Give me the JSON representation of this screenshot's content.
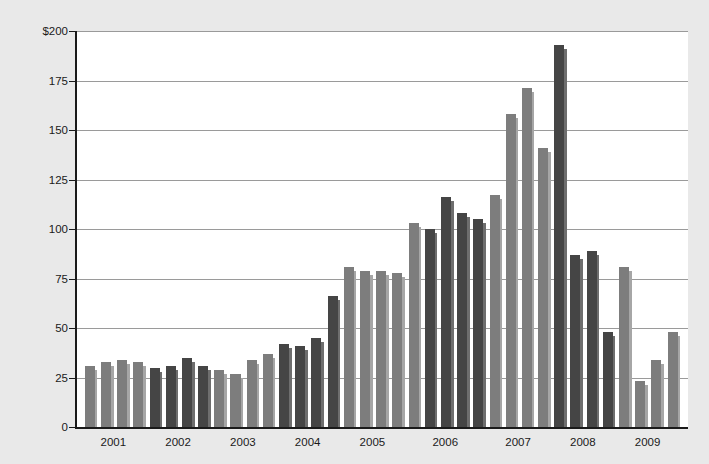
{
  "chart_data": {
    "type": "bar",
    "title": "",
    "subtitle": "",
    "xlabel": "",
    "ylabel": "",
    "ylim": [
      0,
      200
    ],
    "yticks": [
      0,
      25,
      50,
      75,
      100,
      125,
      150,
      175,
      200
    ],
    "ytick_labels": [
      "0",
      "25",
      "50",
      "75",
      "100",
      "125",
      "150",
      "175",
      "$200"
    ],
    "grid": true,
    "legend": "none",
    "categories": [
      "2001",
      "2002",
      "2003",
      "2004",
      "2005",
      "2006",
      "2007",
      "2008",
      "2009"
    ],
    "bars_per_category": 4,
    "colors": {
      "light_series": "#7d7d7d",
      "dark_series": "#454545",
      "light_shadow": "#a6a6a6",
      "dark_shadow": "#6e6e6e",
      "gridline": "#9a9a9a",
      "axis": "#1a1a1a",
      "plot_background": "#ffffff",
      "page_background": "#e9e9e9"
    },
    "groups": [
      {
        "category": "2001",
        "shade": "light",
        "values": [
          31,
          26,
          33,
          29,
          34,
          30,
          33,
          30
        ]
      },
      {
        "category": "2002",
        "shade": "dark",
        "values": [
          30,
          28,
          31,
          29,
          35,
          31,
          31,
          28
        ]
      },
      {
        "category": "2003",
        "shade": "light",
        "values": [
          29,
          27,
          27,
          25,
          34,
          31,
          37,
          33
        ]
      },
      {
        "category": "2004",
        "shade": "dark",
        "values": [
          42,
          40,
          41,
          39,
          45,
          42,
          66,
          62
        ]
      },
      {
        "category": "2005",
        "shade": "light",
        "values": [
          81,
          80,
          79,
          78,
          79,
          77,
          78,
          76
        ]
      },
      {
        "category": "2006",
        "shade": "dark",
        "values": [
          103,
          100,
          100,
          99,
          116,
          112,
          108,
          105,
          105,
          102
        ]
      },
      {
        "category": "2007",
        "shade": "light",
        "values": [
          117,
          113,
          158,
          152,
          171,
          166,
          141,
          137
        ]
      },
      {
        "category": "2008",
        "shade": "dark",
        "values": [
          193,
          189,
          87,
          85,
          89,
          87,
          48,
          45
        ]
      },
      {
        "category": "2009",
        "shade": "light",
        "values": [
          81,
          78,
          23,
          20,
          34,
          31,
          48,
          45
        ]
      }
    ],
    "series_flat": [
      {
        "year": "2001",
        "quarter": 1,
        "value": 31,
        "shade": "light"
      },
      {
        "year": "2001",
        "quarter": 2,
        "value": 33,
        "shade": "light"
      },
      {
        "year": "2001",
        "quarter": 3,
        "value": 34,
        "shade": "light"
      },
      {
        "year": "2001",
        "quarter": 4,
        "value": 33,
        "shade": "light"
      },
      {
        "year": "2002",
        "quarter": 1,
        "value": 30,
        "shade": "dark"
      },
      {
        "year": "2002",
        "quarter": 2,
        "value": 31,
        "shade": "dark"
      },
      {
        "year": "2002",
        "quarter": 3,
        "value": 35,
        "shade": "dark"
      },
      {
        "year": "2002",
        "quarter": 4,
        "value": 31,
        "shade": "dark"
      },
      {
        "year": "2003",
        "quarter": 1,
        "value": 29,
        "shade": "light"
      },
      {
        "year": "2003",
        "quarter": 2,
        "value": 27,
        "shade": "light"
      },
      {
        "year": "2003",
        "quarter": 3,
        "value": 34,
        "shade": "light"
      },
      {
        "year": "2003",
        "quarter": 4,
        "value": 37,
        "shade": "light"
      },
      {
        "year": "2004",
        "quarter": 1,
        "value": 42,
        "shade": "dark"
      },
      {
        "year": "2004",
        "quarter": 2,
        "value": 41,
        "shade": "dark"
      },
      {
        "year": "2004",
        "quarter": 3,
        "value": 45,
        "shade": "dark"
      },
      {
        "year": "2004",
        "quarter": 4,
        "value": 66,
        "shade": "dark"
      },
      {
        "year": "2005",
        "quarter": 1,
        "value": 81,
        "shade": "light"
      },
      {
        "year": "2005",
        "quarter": 2,
        "value": 79,
        "shade": "light"
      },
      {
        "year": "2005",
        "quarter": 3,
        "value": 79,
        "shade": "light"
      },
      {
        "year": "2005",
        "quarter": 4,
        "value": 78,
        "shade": "light"
      },
      {
        "year": "2006",
        "quarter": 1,
        "value": 103,
        "shade": "light"
      },
      {
        "year": "2006",
        "quarter": 2,
        "value": 100,
        "shade": "dark"
      },
      {
        "year": "2006",
        "quarter": 3,
        "value": 116,
        "shade": "dark"
      },
      {
        "year": "2006",
        "quarter": 4,
        "value": 108,
        "shade": "dark"
      },
      {
        "year": "2006",
        "quarter": 5,
        "value": 105,
        "shade": "dark"
      },
      {
        "year": "2007",
        "quarter": 1,
        "value": 117,
        "shade": "light"
      },
      {
        "year": "2007",
        "quarter": 2,
        "value": 158,
        "shade": "light"
      },
      {
        "year": "2007",
        "quarter": 3,
        "value": 171,
        "shade": "light"
      },
      {
        "year": "2007",
        "quarter": 4,
        "value": 141,
        "shade": "light"
      },
      {
        "year": "2008",
        "quarter": 1,
        "value": 193,
        "shade": "dark"
      },
      {
        "year": "2008",
        "quarter": 2,
        "value": 87,
        "shade": "dark"
      },
      {
        "year": "2008",
        "quarter": 3,
        "value": 89,
        "shade": "dark"
      },
      {
        "year": "2008",
        "quarter": 4,
        "value": 48,
        "shade": "dark"
      },
      {
        "year": "2009",
        "quarter": 1,
        "value": 81,
        "shade": "light"
      },
      {
        "year": "2009",
        "quarter": 2,
        "value": 23,
        "shade": "light"
      },
      {
        "year": "2009",
        "quarter": 3,
        "value": 34,
        "shade": "light"
      },
      {
        "year": "2009",
        "quarter": 4,
        "value": 48,
        "shade": "light"
      }
    ]
  }
}
